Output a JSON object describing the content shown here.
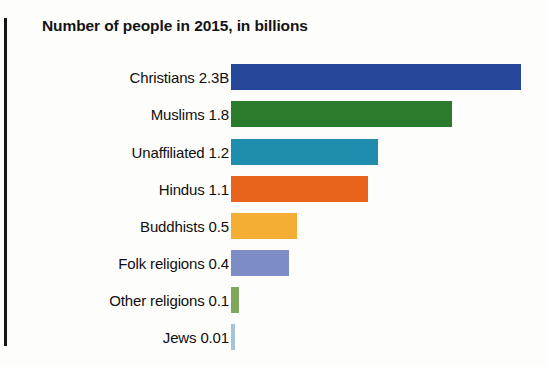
{
  "chart_data": {
    "type": "bar",
    "orientation": "horizontal",
    "title": "Number of people in 2015, in billions",
    "xlabel": "",
    "ylabel": "",
    "xlim": [
      0,
      2.3
    ],
    "grid": false,
    "legend": "none",
    "axis_ticks_shown": false,
    "categories": [
      "Christians",
      "Muslims",
      "Unaffiliated",
      "Hindus",
      "Buddhists",
      "Folk religions",
      "Other religions",
      "Jews"
    ],
    "values": [
      2.3,
      1.8,
      1.2,
      1.1,
      0.5,
      0.4,
      0.1,
      0.01
    ],
    "value_labels": [
      "2.3B",
      "1.8",
      "1.2",
      "1.1",
      "0.5",
      "0.4",
      "0.1",
      "0.01"
    ],
    "tick_labels": [
      "Christians 2.3B",
      "Muslims 1.8",
      "Unaffiliated 1.2",
      "Hindus 1.1",
      "Buddhists 0.5",
      "Folk religions 0.4",
      "Other religions 0.1",
      "Jews 0.01"
    ],
    "colors": [
      "#24479a",
      "#2c7a2c",
      "#1e8dae",
      "#e8631c",
      "#f5ae34",
      "#7d8cc4",
      "#7fa85c",
      "#a8c4d4"
    ],
    "bars": [
      {
        "category": "Christians",
        "label": "Christians 2.3B",
        "value": 2.3,
        "value_label": "2.3B",
        "color": "#24479a",
        "bar_px": 290,
        "top_px": 6
      },
      {
        "category": "Muslims",
        "label": "Muslims 1.8",
        "value": 1.8,
        "value_label": "1.8",
        "color": "#2c7a2c",
        "bar_px": 221,
        "top_px": 43
      },
      {
        "category": "Unaffiliated",
        "label": "Unaffiliated 1.2",
        "value": 1.2,
        "value_label": "1.2",
        "color": "#1e8dae",
        "bar_px": 147,
        "top_px": 81
      },
      {
        "category": "Hindus",
        "label": "Hindus 1.1",
        "value": 1.1,
        "value_label": "1.1",
        "color": "#e8631c",
        "bar_px": 137,
        "top_px": 118
      },
      {
        "category": "Buddhists",
        "label": "Buddhists 0.5",
        "value": 0.5,
        "value_label": "0.5",
        "color": "#f5ae34",
        "bar_px": 66,
        "top_px": 155
      },
      {
        "category": "Folk religions",
        "label": "Folk religions 0.4",
        "value": 0.4,
        "value_label": "0.4",
        "color": "#7d8cc4",
        "bar_px": 58,
        "top_px": 192
      },
      {
        "category": "Other religions",
        "label": "Other religions 0.1",
        "value": 0.1,
        "value_label": "0.1",
        "color": "#7fa85c",
        "bar_px": 8,
        "top_px": 229
      },
      {
        "category": "Jews",
        "label": "Jews 0.01",
        "value": 0.01,
        "value_label": "0.01",
        "color": "#a8c4d4",
        "bar_px": 4,
        "top_px": 266
      }
    ]
  }
}
